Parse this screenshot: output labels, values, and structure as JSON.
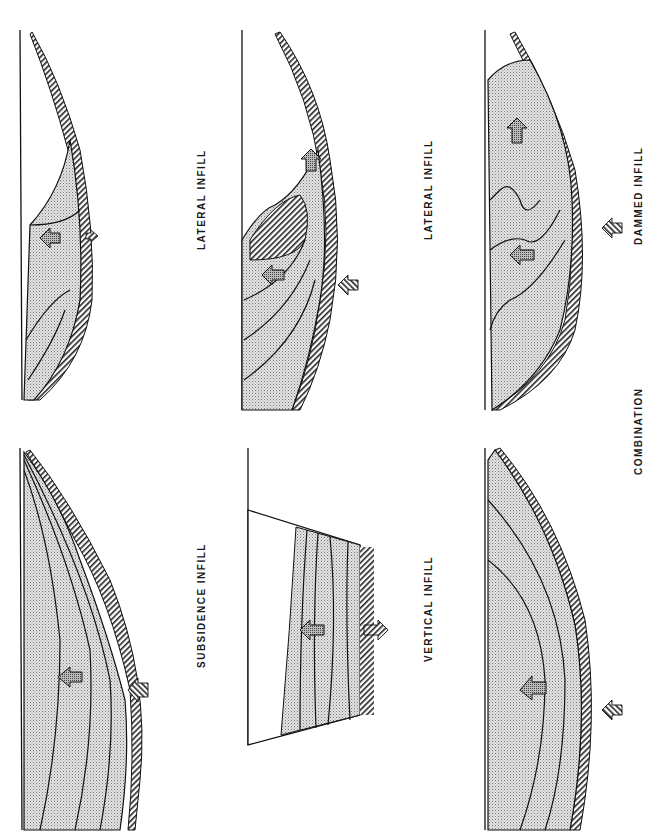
{
  "figure": {
    "orientation": "rotated 90 degrees counter-clockwise",
    "colors": {
      "line": "#111111",
      "fill_stipple": "#c8c8c8",
      "background": "#ffffff"
    },
    "panels": [
      {
        "id": "lateral",
        "label": "LATERAL INFILL",
        "arrows": [
          "infill-direction-arrow",
          "subsidence-arrow"
        ]
      },
      {
        "id": "subsidence",
        "label": "SUBSIDENCE INFILL",
        "arrows": [
          "infill-direction-arrow",
          "subsidence-arrow"
        ]
      },
      {
        "id": "lateral-2",
        "label": "LATERAL INFILL",
        "arrows": [
          "infill-direction-arrow",
          "subsidence-arrow"
        ]
      },
      {
        "id": "vertical",
        "label": "VERTICAL INFILL",
        "arrows": [
          "infill-direction-arrow",
          "subsidence-arrow"
        ]
      },
      {
        "id": "dammed",
        "label": "DAMMED INFILL",
        "arrows": [
          "infill-direction-arrow",
          "infill-direction-arrow",
          "subsidence-arrow"
        ]
      },
      {
        "id": "combination",
        "label": "COMBINATION",
        "arrows": [
          "infill-direction-arrow",
          "subsidence-arrow"
        ]
      }
    ],
    "labels": {
      "lateral": "LATERAL INFILL",
      "subsidence": "SUBSIDENCE INFILL",
      "vertical": "VERTICAL INFILL",
      "dammed": "DAMMED INFILL",
      "combination": "COMBINATION"
    }
  }
}
